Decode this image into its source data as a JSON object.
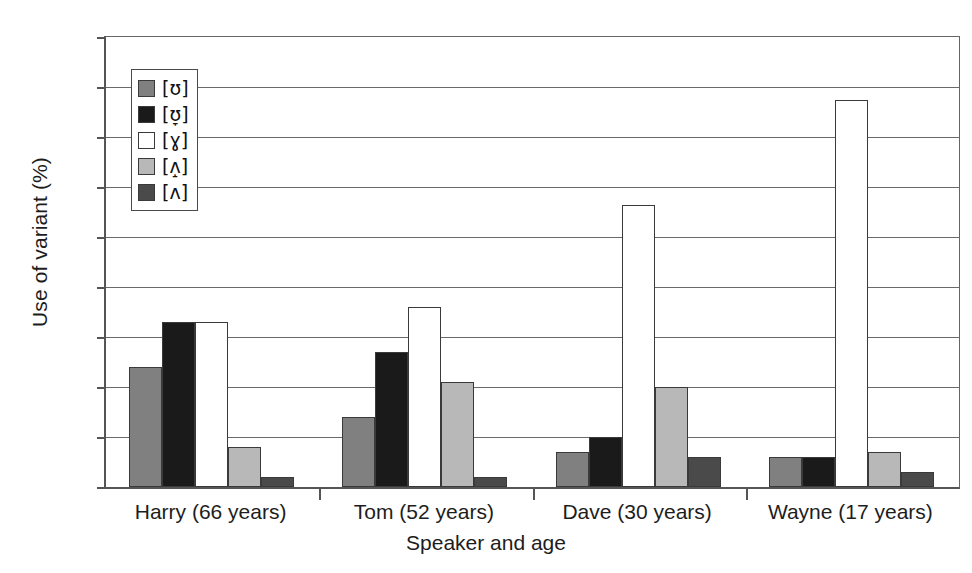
{
  "chart_data": {
    "type": "bar",
    "title": "",
    "xlabel": "Speaker and age",
    "ylabel": "Use of variant (%)",
    "ylim": [
      0,
      90
    ],
    "ytick_step": 10,
    "yticks": [
      90,
      80,
      70,
      60,
      50,
      40,
      30,
      20,
      10,
      0
    ],
    "grid": true,
    "legend_position": "upper-left-inside",
    "categories": [
      "Harry (66 years)",
      "Tom (52 years)",
      "Dave (30 years)",
      "Wayne (17 years)"
    ],
    "series": [
      {
        "name": "[ʊ]",
        "color": "#808080",
        "values": [
          24,
          14,
          7,
          6
        ]
      },
      {
        "name": "[ʊ̞]",
        "color": "#1a1a1a",
        "values": [
          33,
          27,
          10,
          6
        ]
      },
      {
        "name": "[ɣ]",
        "color": "#ffffff",
        "values": [
          33,
          36,
          56.5,
          77.5
        ]
      },
      {
        "name": "[ʌ̝]",
        "color": "#b8b8b8",
        "values": [
          8,
          21,
          20,
          7
        ]
      },
      {
        "name": "[ʌ]",
        "color": "#4a4a4a",
        "values": [
          2,
          2,
          6,
          3
        ]
      }
    ]
  },
  "legend": {
    "items": [
      {
        "label": "[ʊ]",
        "color": "#808080"
      },
      {
        "label": "[ʊ̞]",
        "color": "#1a1a1a"
      },
      {
        "label": "[ɣ]",
        "color": "#ffffff"
      },
      {
        "label": "[ʌ̝]",
        "color": "#b8b8b8"
      },
      {
        "label": "[ʌ]",
        "color": "#4a4a4a"
      }
    ]
  }
}
